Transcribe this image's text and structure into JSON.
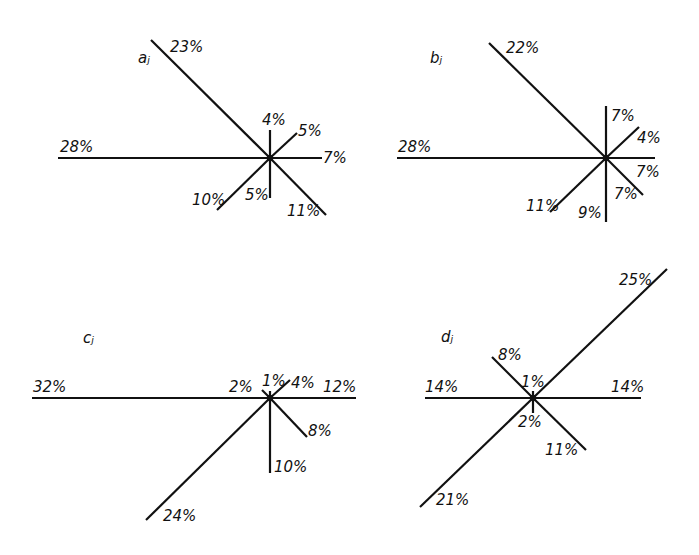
{
  "figure": {
    "panels": [
      {
        "id": "a",
        "label": "aⱼ",
        "center": [
          270,
          158
        ],
        "rays": [
          {
            "dir": "W",
            "value": "28%",
            "end": [
              58,
              158
            ],
            "text_pos": [
              60,
              152
            ]
          },
          {
            "dir": "NW",
            "value": "23%",
            "end": [
              151,
              40
            ],
            "text_pos": [
              170,
              52
            ]
          },
          {
            "dir": "N",
            "value": "4%",
            "end": [
              270,
              130
            ],
            "text_pos": [
              262,
              125
            ]
          },
          {
            "dir": "NE",
            "value": "5%",
            "end": [
              297,
              133
            ],
            "text_pos": [
              298,
              136
            ]
          },
          {
            "dir": "E",
            "value": "7%",
            "end": [
              322,
              158
            ],
            "text_pos": [
              323,
              163
            ]
          },
          {
            "dir": "S",
            "value": "5%",
            "end": [
              270,
              198
            ],
            "text_pos": [
              245,
              200
            ]
          },
          {
            "dir": "SW",
            "value": "10%",
            "end": [
              217,
              210
            ],
            "text_pos": [
              192,
              205
            ]
          },
          {
            "dir": "SE",
            "value": "11%",
            "end": [
              326,
              215
            ],
            "text_pos": [
              287,
              216
            ]
          }
        ]
      },
      {
        "id": "b",
        "label": "bⱼ",
        "center": [
          606,
          158
        ],
        "rays": [
          {
            "dir": "W",
            "value": "28%",
            "end": [
              397,
              158
            ],
            "text_pos": [
              398,
              152
            ]
          },
          {
            "dir": "NW",
            "value": "22%",
            "end": [
              489,
              43
            ],
            "text_pos": [
              506,
              53
            ]
          },
          {
            "dir": "N",
            "value": "7%",
            "end": [
              606,
              106
            ],
            "text_pos": [
              611,
              121
            ]
          },
          {
            "dir": "NE",
            "value": "4%",
            "end": [
              639,
              127
            ],
            "text_pos": [
              637,
              143
            ]
          },
          {
            "dir": "E",
            "value": "7%",
            "end": [
              655,
              158
            ],
            "text_pos": [
              636,
              177
            ]
          },
          {
            "dir": "S",
            "value": "9%",
            "end": [
              606,
              222
            ],
            "text_pos": [
              578,
              218
            ]
          },
          {
            "dir": "SW",
            "value": "11%",
            "end": [
              550,
              212
            ],
            "text_pos": [
              526,
              211
            ]
          },
          {
            "dir": "SE",
            "value": "7%",
            "end": [
              643,
              195
            ],
            "text_pos": [
              614,
              199
            ]
          }
        ]
      },
      {
        "id": "c",
        "label": "cⱼ",
        "center": [
          270,
          398
        ],
        "rays": [
          {
            "dir": "W",
            "value": "32%",
            "end": [
              32,
              398
            ],
            "text_pos": [
              33,
              392
            ]
          },
          {
            "dir": "NW",
            "value": "2%",
            "end": [
              262,
              390
            ],
            "text_pos": [
              229,
              392
            ]
          },
          {
            "dir": "N",
            "value": "1%",
            "end": [
              270,
              391
            ],
            "text_pos": [
              262,
              386
            ]
          },
          {
            "dir": "NE",
            "value": "4%",
            "end": [
              290,
              380
            ],
            "text_pos": [
              291,
              388
            ]
          },
          {
            "dir": "E",
            "value": "12%",
            "end": [
              356,
              398
            ],
            "text_pos": [
              323,
              392
            ]
          },
          {
            "dir": "SE",
            "value": "8%",
            "end": [
              307,
              437
            ],
            "text_pos": [
              308,
              436
            ]
          },
          {
            "dir": "S",
            "value": "10%",
            "end": [
              270,
              473
            ],
            "text_pos": [
              274,
              472
            ]
          },
          {
            "dir": "SW",
            "value": "24%",
            "end": [
              146,
              520
            ],
            "text_pos": [
              163,
              521
            ]
          }
        ]
      },
      {
        "id": "d",
        "label": "dⱼ",
        "center": [
          533,
          398
        ],
        "rays": [
          {
            "dir": "W",
            "value": "14%",
            "end": [
              425,
              398
            ],
            "text_pos": [
              425,
              392
            ]
          },
          {
            "dir": "E",
            "value": "14%",
            "end": [
              641,
              398
            ],
            "text_pos": [
              611,
              392
            ]
          },
          {
            "dir": "NE",
            "value": "25%",
            "end": [
              667,
              269
            ],
            "text_pos": [
              619,
              285
            ]
          },
          {
            "dir": "SW",
            "value": "21%",
            "end": [
              420,
              507
            ],
            "text_pos": [
              436,
              505
            ]
          },
          {
            "dir": "NW",
            "value": "8%",
            "end": [
              492,
              357
            ],
            "text_pos": [
              498,
              360
            ]
          },
          {
            "dir": "N",
            "value": "1%",
            "end": [
              533,
              391
            ],
            "text_pos": [
              521,
              387
            ]
          },
          {
            "dir": "S",
            "value": "2%",
            "end": [
              533,
              413
            ],
            "text_pos": [
              518,
              427
            ]
          },
          {
            "dir": "SE",
            "value": "11%",
            "end": [
              586,
              450
            ],
            "text_pos": [
              545,
              455
            ]
          }
        ]
      }
    ]
  },
  "panel_label_positions": {
    "a": [
      138,
      63
    ],
    "b": [
      430,
      63
    ],
    "c": [
      83,
      343
    ],
    "d": [
      441,
      342
    ]
  },
  "colors": {
    "ink": "#111111",
    "background": "#ffffff"
  }
}
